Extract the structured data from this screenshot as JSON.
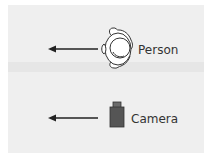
{
  "diagram": {
    "colors": {
      "background": "#efefef",
      "band": "#e6e6e6",
      "arrow": "#222222",
      "camera_body": "#555555",
      "outline": "#333333"
    },
    "rows": [
      {
        "label": "Person",
        "icon": "person-top-view-icon",
        "arrow": "left-arrow",
        "direction": "left"
      },
      {
        "label": "Camera",
        "icon": "camera-icon",
        "arrow": "left-arrow",
        "direction": "left"
      }
    ]
  }
}
